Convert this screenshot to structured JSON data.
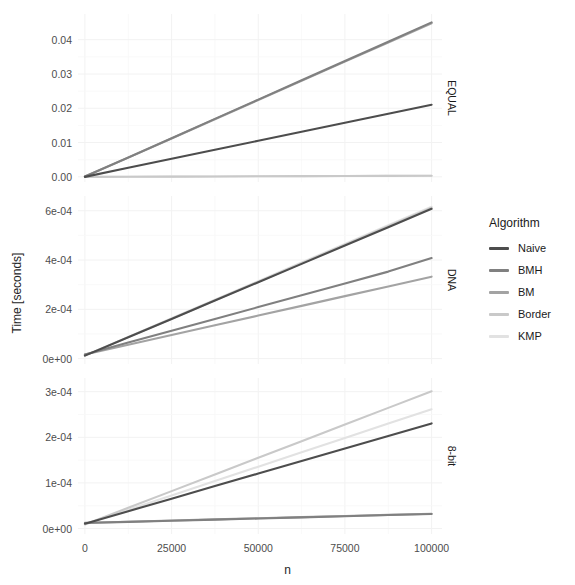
{
  "chart_data": {
    "type": "line",
    "title": "",
    "xlabel": "n",
    "ylabel": "Time [seconds]",
    "x": [
      0,
      12500,
      25000,
      37500,
      50000,
      62500,
      75000,
      87500,
      100000
    ],
    "xlim": [
      -2000,
      103000
    ],
    "xticks": [
      0,
      25000,
      50000,
      75000,
      100000
    ],
    "xtick_labels": [
      "0",
      "25000",
      "50000",
      "75000",
      "100000"
    ],
    "grid": true,
    "legend_position": "right",
    "legend_title": "Algorithm",
    "facet_variable": "alphabet",
    "panels": [
      {
        "strip_label": "EQUAL",
        "ylim": [
          -0.0015,
          0.0475
        ],
        "yticks": [
          0.0,
          0.01,
          0.02,
          0.03,
          0.04
        ],
        "ytick_labels": [
          "0.00",
          "0.01",
          "0.02",
          "0.03",
          "0.04"
        ],
        "series": [
          {
            "name": "Naive",
            "values": [
              0.0,
              0.00265,
              0.00527,
              0.0079,
              0.01052,
              0.01315,
              0.01578,
              0.0184,
              0.02103
            ]
          },
          {
            "name": "BMH",
            "values": [
              0.0001,
              0.00563,
              0.01127,
              0.0169,
              0.02253,
              0.02817,
              0.0338,
              0.03943,
              0.04506
            ]
          },
          {
            "name": "BM",
            "values": [
              0.0001,
              0.0056,
              0.0112,
              0.0168,
              0.0224,
              0.028,
              0.0336,
              0.0392,
              0.0448
            ]
          },
          {
            "name": "Border",
            "values": [
              0.0,
              4e-05,
              8e-05,
              0.00012,
              0.00016,
              0.0002,
              0.00024,
              0.00028,
              0.00032
            ]
          },
          {
            "name": "KMP",
            "values": [
              0.0,
              4e-05,
              8e-05,
              0.00012,
              0.00016,
              0.0002,
              0.00024,
              0.00028,
              0.00032
            ]
          }
        ]
      },
      {
        "strip_label": "DNA",
        "ylim": [
          -2.2e-05,
          0.00066
        ],
        "yticks": [
          0.0,
          0.0002,
          0.0004,
          0.0006
        ],
        "ytick_labels": [
          "0e+00",
          "2e-04",
          "4e-04",
          "6e-04"
        ],
        "series": [
          {
            "name": "Naive",
            "values": [
              1.2e-05,
              8.65e-05,
              0.000161,
              0.0002355,
              0.00031,
              0.0003845,
              0.000459,
              0.0005335,
              0.000608
            ]
          },
          {
            "name": "BMH",
            "values": [
              1.7e-05,
              6.5e-05,
              0.000113,
              0.000161,
              0.000209,
              0.000257,
              0.000305,
              0.000353,
              0.000408
            ]
          },
          {
            "name": "BM",
            "values": [
              1.65e-05,
              5.6e-05,
              9.55e-05,
              0.000135,
              0.0001745,
              0.000214,
              0.0002535,
              0.000293,
              0.0003325
            ]
          },
          {
            "name": "Border",
            "values": [
              1.2e-05,
              8.7e-05,
              0.000162,
              0.000237,
              0.000312,
              0.000387,
              0.000462,
              0.000537,
              0.000612
            ]
          },
          {
            "name": "KMP",
            "values": [
              1.25e-05,
              8.8e-05,
              0.0001635,
              0.000239,
              0.0003145,
              0.00039,
              0.0004655,
              0.000541,
              0.0006165
            ]
          }
        ]
      },
      {
        "strip_label": "8-bit",
        "ylim": [
          -1.2e-05,
          0.00033
        ],
        "yticks": [
          0.0,
          0.0001,
          0.0002,
          0.0003
        ],
        "ytick_labels": [
          "0e+00",
          "1e-04",
          "2e-04",
          "3e-04"
        ],
        "series": [
          {
            "name": "Naive",
            "values": [
              1.05e-05,
              3.8e-05,
              6.55e-05,
              9.3e-05,
              0.0001205,
              0.000148,
              0.0001755,
              0.000203,
              0.0002305
            ]
          },
          {
            "name": "BMH",
            "values": [
              1.2e-05,
              1.45e-05,
              1.7e-05,
              1.95e-05,
              2.2e-05,
              2.45e-05,
              2.7e-05,
              2.95e-05,
              3.2e-05
            ]
          },
          {
            "name": "BM",
            "values": [
              1.25e-05,
              1.5e-05,
              1.75e-05,
              2e-05,
              2.25e-05,
              2.5e-05,
              2.75e-05,
              3e-05,
              3.25e-05
            ]
          },
          {
            "name": "Border",
            "values": [
              9e-06,
              4.55e-05,
              8.2e-05,
              0.0001185,
              0.000155,
              0.0001915,
              0.000228,
              0.0002645,
              0.000301
            ]
          },
          {
            "name": "KMP",
            "values": [
              9.5e-06,
              4.1e-05,
              7.25e-05,
              0.000104,
              0.0001355,
              0.000167,
              0.0001985,
              0.00023,
              0.0002615
            ]
          }
        ]
      }
    ],
    "series_colors": {
      "Naive": "#4d4d4d",
      "BMH": "#808080",
      "BM": "#a3a3a3",
      "Border": "#c9c9c9",
      "KMP": "#e2e2e2"
    },
    "legend_entries": [
      "Naive",
      "BMH",
      "BM",
      "Border",
      "KMP"
    ]
  },
  "legend": {
    "title": "Algorithm",
    "items": [
      {
        "label": "Naive",
        "color": "#4d4d4d"
      },
      {
        "label": "BMH",
        "color": "#808080"
      },
      {
        "label": "BM",
        "color": "#a3a3a3"
      },
      {
        "label": "Border",
        "color": "#c9c9c9"
      },
      {
        "label": "KMP",
        "color": "#e2e2e2"
      }
    ]
  },
  "axes": {
    "y_title": "Time [seconds]",
    "x_title": "n"
  },
  "panel_geometry": [
    {
      "x": 78,
      "y": 14,
      "w": 364,
      "h": 168
    },
    {
      "x": 78,
      "y": 196,
      "w": 364,
      "h": 168
    },
    {
      "x": 78,
      "y": 378,
      "w": 364,
      "h": 156
    }
  ],
  "strip_geometry": [
    {
      "x": 444,
      "y": 14,
      "w": 16,
      "h": 168
    },
    {
      "x": 444,
      "y": 196,
      "w": 16,
      "h": 168
    },
    {
      "x": 444,
      "y": 378,
      "w": 16,
      "h": 156
    }
  ],
  "colors": {
    "background": "#ffffff",
    "gridline": "#f2f2f2",
    "text": "#4d4d4d"
  }
}
